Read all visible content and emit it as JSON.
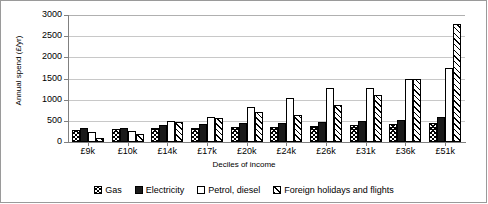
{
  "chart_data": {
    "type": "bar",
    "title": "",
    "xlabel": "Deciles of income",
    "ylabel": "Annual spend (£/yr)",
    "ylim": [
      0,
      3000
    ],
    "ytick_step": 500,
    "yticks": [
      "3000",
      "2500",
      "2000",
      "1500",
      "1000",
      "500",
      "0"
    ],
    "grid": true,
    "legend_position": "bottom",
    "categories": [
      "£9k",
      "£10k",
      "£14k",
      "£17k",
      "£20k",
      "£24k",
      "£26k",
      "£31k",
      "£36k",
      "£51k"
    ],
    "series": [
      {
        "name": "Gas",
        "pattern": "cross-hatch",
        "values": [
          290,
          300,
          320,
          330,
          350,
          360,
          380,
          400,
          420,
          440
        ]
      },
      {
        "name": "Electricity",
        "pattern": "solid-dark",
        "values": [
          330,
          340,
          400,
          420,
          440,
          460,
          480,
          500,
          520,
          600
        ]
      },
      {
        "name": "Petrol, diesel",
        "pattern": "white",
        "values": [
          230,
          260,
          500,
          600,
          830,
          1050,
          1270,
          1270,
          1500,
          1750
        ]
      },
      {
        "name": "Foreign holidays and flights",
        "pattern": "diagonal-hatch",
        "values": [
          100,
          180,
          480,
          560,
          700,
          640,
          880,
          1110,
          1480,
          2780
        ]
      }
    ]
  },
  "legend": {
    "items": [
      {
        "label": "Gas"
      },
      {
        "label": "Electricity"
      },
      {
        "label": "Petrol, diesel"
      },
      {
        "label": "Foreign holidays and flights"
      }
    ]
  }
}
